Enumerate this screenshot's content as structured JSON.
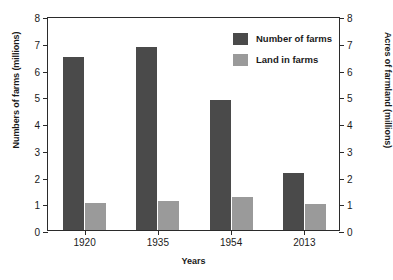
{
  "chart_data": {
    "type": "bar",
    "title": "",
    "xlabel": "Years",
    "ylabel": "Numbers of farms (millions)",
    "y2label": "Acres of farmland (millions)",
    "categories": [
      "1920",
      "1935",
      "1954",
      "2013"
    ],
    "series": [
      {
        "name": "Number of farms",
        "color": "#4a4a4a",
        "axis": "left",
        "values": [
          6.45,
          6.85,
          4.85,
          2.15
        ]
      },
      {
        "name": "Land in farms",
        "color": "#9a9a9a",
        "axis": "right",
        "values": [
          1.02,
          1.1,
          1.25,
          0.98
        ]
      }
    ],
    "ylim": [
      0,
      8
    ],
    "y2lim": [
      0,
      8
    ],
    "yticks": [
      "0",
      "1",
      "2",
      "3",
      "4",
      "5",
      "6",
      "7",
      "8"
    ],
    "y2ticks": [
      "0",
      "1",
      "2",
      "3",
      "4",
      "5",
      "6",
      "7",
      "8"
    ],
    "grid": false,
    "legend_position": "top-right"
  },
  "legend": {
    "items": [
      {
        "label": "Number of farms",
        "swatch": "series-farms"
      },
      {
        "label": "Land in farms",
        "swatch": "series-land"
      }
    ]
  }
}
